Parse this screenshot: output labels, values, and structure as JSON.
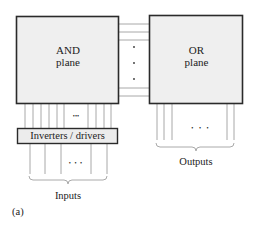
{
  "diagram": {
    "type": "PLA block diagram",
    "and_plane": {
      "line1": "AND",
      "line2": "plane"
    },
    "or_plane": {
      "line1": "OR",
      "line2": "plane"
    },
    "inverters_label": "Inverters / drivers",
    "inputs_label": "Inputs",
    "outputs_label": "Outputs",
    "ellipsis_h": "• • •",
    "ellipsis_small": "•••",
    "caption": "(a)",
    "colors": {
      "box_fill": "#efefef",
      "box_stroke": "#2a2a2a",
      "line": "#9a9a9a"
    }
  }
}
